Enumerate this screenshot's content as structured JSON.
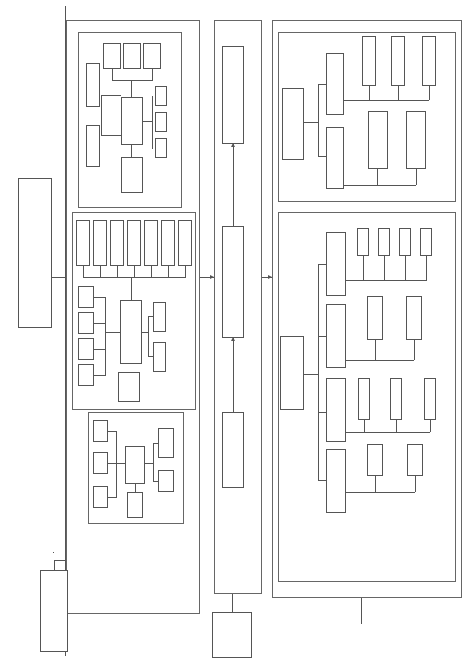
{
  "stages": {
    "stage1": "现状精细化调查与问题诊断",
    "stage2": "污染减排、治理与水环境容量提升目标确定",
    "stage3": "技术方案确定"
  },
  "diagnosis": {
    "model": "水文水质耦合计算模型",
    "problem_diagnosis": "问题诊断",
    "key_source": "关键污染来源",
    "key_area": "关键污染源区",
    "outputs": [
      "污染物迁移转化规律",
      "污染负荷定量计算",
      "纳污水体水质时空变化规律"
    ],
    "sources": [
      "点源",
      "内源",
      "面源"
    ]
  },
  "survey": {
    "center": "实地踏勘、调查检测",
    "items": [
      "水系与水利工程",
      "水环境现状",
      "河道内源",
      "生活污染源",
      "农业污染源",
      "工业污染源",
      "入河排污口"
    ],
    "rivers": [
      "骨干排涝河道",
      "截排涝河道",
      "港渠河道",
      "湖泊湿地等"
    ],
    "tests": [
      "水质检测",
      "底泥检测"
    ],
    "section": "河道断面测量"
  },
  "data_collection": {
    "center": "资料收集",
    "agencies": [
      "住建局",
      "环保局",
      "水利局",
      "国土局",
      "自来水厂",
      "农委"
    ]
  },
  "targets": {
    "allocation": "污染物减排任务计算与分配",
    "reduction": "入河污染负荷目标削减量计算",
    "capacity": "水环境容量分析计算"
  },
  "capacity_improvement": {
    "title": "水环境容量提升",
    "restoration": "河道生态修复",
    "hydrodynamic": "水动力调控",
    "restoration_items": [
      "岸线规定与管控",
      "护坡保护与修复",
      "生态修复措施"
    ],
    "hydro_items": [
      "水文水动力耦合模型与活水效果模拟",
      "活水方案比选与优化"
    ]
  },
  "comprehensive": {
    "title": "水环境综合整治",
    "nonpoint": "面源污染防治",
    "nonpoint_items": [
      "城市径流",
      "种植业",
      "畜禽养殖",
      "水产养殖"
    ],
    "internal": "内源污染防治",
    "internal_items": [
      "清淤分析",
      "清淤方案确定"
    ],
    "industrial": "工业污染防治",
    "industrial_items": [
      "企业排查",
      "控污措施",
      "监管措施"
    ],
    "domestic": "生活污染防治",
    "domestic_items": [
      "老城区",
      "新城区"
    ]
  }
}
